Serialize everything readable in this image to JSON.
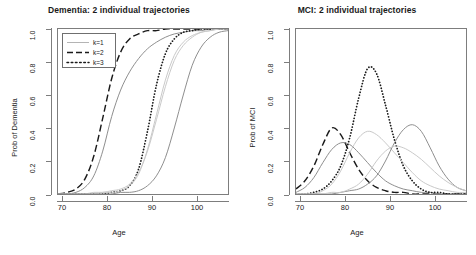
{
  "figure": {
    "xlabel": "Age",
    "panels": [
      {
        "id": "dementia",
        "title": "Dementia: 2 individual trajectories",
        "ylabel": "Prob of Dementia"
      },
      {
        "id": "mci",
        "title": "MCI: 2 individual trajectories",
        "ylabel": "Prob of MCI"
      }
    ]
  },
  "legend": {
    "items": [
      {
        "label": "k=1",
        "style": "solid",
        "color": "#aeaeae"
      },
      {
        "label": "k=2",
        "style": "dashed",
        "color": "#1a1a1a"
      },
      {
        "label": "k=3",
        "style": "dotted",
        "color": "#1a1a1a"
      }
    ]
  },
  "axes": {
    "x_ticks": [
      "70",
      "80",
      "90",
      "100"
    ],
    "y_ticks": [
      "0.0",
      "0.2",
      "0.4",
      "0.6",
      "0.8",
      "1.0"
    ]
  },
  "chart_data": [
    {
      "type": "line",
      "title": "Dementia: 2 individual trajectories",
      "xlabel": "Age",
      "ylabel": "Prob of Dementia",
      "xlim": [
        70,
        108
      ],
      "ylim": [
        0.0,
        1.0
      ],
      "xticks": [
        70,
        80,
        90,
        100
      ],
      "yticks": [
        0.0,
        0.2,
        0.4,
        0.6,
        0.8,
        1.0
      ],
      "grid": false,
      "legend_position": "top-left",
      "note": "Logistic (sigmoid) cumulative probability curves; 2 individual trajectories drawn for each latent class k.",
      "x": [
        70,
        72,
        74,
        76,
        78,
        80,
        82,
        84,
        86,
        88,
        90,
        92,
        94,
        96,
        98,
        100,
        102,
        104,
        106,
        108
      ],
      "series": [
        {
          "name": "k=2 individual A",
          "style": "dashed",
          "color": "#1a1a1a",
          "midpoint_age": 81,
          "values": [
            0.0,
            0.01,
            0.03,
            0.09,
            0.23,
            0.46,
            0.7,
            0.86,
            0.94,
            0.97,
            0.99,
            0.99,
            1.0,
            1.0,
            1.0,
            1.0,
            1.0,
            1.0,
            1.0,
            1.0
          ]
        },
        {
          "name": "k=2 individual B",
          "style": "solid",
          "color": "#8c8c8c",
          "midpoint_age": 83,
          "values": [
            0.0,
            0.0,
            0.01,
            0.04,
            0.11,
            0.26,
            0.47,
            0.63,
            0.74,
            0.82,
            0.88,
            0.92,
            0.95,
            0.97,
            0.98,
            0.99,
            0.99,
            1.0,
            1.0,
            1.0
          ]
        },
        {
          "name": "k=3 individual A",
          "style": "dotted",
          "color": "#1a1a1a",
          "midpoint_age": 90,
          "values": [
            0.0,
            0.0,
            0.0,
            0.0,
            0.0,
            0.0,
            0.01,
            0.02,
            0.05,
            0.15,
            0.38,
            0.66,
            0.85,
            0.94,
            0.98,
            0.99,
            1.0,
            1.0,
            1.0,
            1.0
          ]
        },
        {
          "name": "k=3 individual B",
          "style": "solid",
          "color": "#c8c8c8",
          "midpoint_age": 92,
          "values": [
            0.0,
            0.0,
            0.0,
            0.0,
            0.0,
            0.01,
            0.01,
            0.02,
            0.05,
            0.12,
            0.27,
            0.48,
            0.69,
            0.84,
            0.92,
            0.96,
            0.98,
            0.99,
            1.0,
            1.0
          ]
        },
        {
          "name": "k=1 individual A",
          "style": "solid",
          "color": "#c8c8c8",
          "midpoint_age": 93,
          "values": [
            0.0,
            0.0,
            0.0,
            0.0,
            0.01,
            0.01,
            0.02,
            0.03,
            0.06,
            0.13,
            0.26,
            0.45,
            0.65,
            0.81,
            0.9,
            0.95,
            0.98,
            0.99,
            1.0,
            1.0
          ]
        },
        {
          "name": "k=1 individual B",
          "style": "solid",
          "color": "#8c8c8c",
          "midpoint_age": 97,
          "values": [
            0.0,
            0.0,
            0.0,
            0.0,
            0.0,
            0.0,
            0.0,
            0.01,
            0.01,
            0.02,
            0.05,
            0.11,
            0.22,
            0.4,
            0.6,
            0.78,
            0.89,
            0.95,
            0.98,
            0.99
          ]
        }
      ]
    },
    {
      "type": "line",
      "title": "MCI: 2 individual trajectories",
      "xlabel": "Age",
      "ylabel": "Prob of MCI",
      "xlim": [
        70,
        108
      ],
      "ylim": [
        0.0,
        1.0
      ],
      "xticks": [
        70,
        80,
        90,
        100
      ],
      "yticks": [
        0.0,
        0.2,
        0.4,
        0.6,
        0.8,
        1.0
      ],
      "grid": false,
      "legend_position": "none",
      "note": "Unimodal (bell-shaped) prevalence curves; 2 individual trajectories drawn for each latent class k.",
      "x": [
        70,
        72,
        74,
        76,
        78,
        80,
        82,
        84,
        86,
        88,
        90,
        92,
        94,
        96,
        98,
        100,
        102,
        104,
        106,
        108
      ],
      "series": [
        {
          "name": "k=2 individual A",
          "style": "dashed",
          "color": "#1a1a1a",
          "peak_age": 78.5,
          "peak_value": 0.4,
          "values": [
            0.03,
            0.08,
            0.17,
            0.3,
            0.4,
            0.36,
            0.25,
            0.15,
            0.08,
            0.04,
            0.02,
            0.01,
            0.01,
            0.0,
            0.0,
            0.0,
            0.0,
            0.0,
            0.0,
            0.0
          ]
        },
        {
          "name": "k=2 individual B",
          "style": "solid",
          "color": "#8c8c8c",
          "peak_age": 81,
          "peak_value": 0.31,
          "values": [
            0.01,
            0.04,
            0.1,
            0.19,
            0.27,
            0.31,
            0.3,
            0.25,
            0.19,
            0.13,
            0.08,
            0.05,
            0.03,
            0.02,
            0.01,
            0.01,
            0.0,
            0.0,
            0.0,
            0.0
          ]
        },
        {
          "name": "k=3 individual A",
          "style": "dotted",
          "color": "#1a1a1a",
          "peak_age": 86,
          "peak_value": 0.78,
          "values": [
            0.0,
            0.0,
            0.01,
            0.03,
            0.08,
            0.17,
            0.34,
            0.58,
            0.76,
            0.73,
            0.54,
            0.33,
            0.17,
            0.08,
            0.03,
            0.01,
            0.01,
            0.0,
            0.0,
            0.0
          ]
        },
        {
          "name": "k=3 individual B",
          "style": "solid",
          "color": "#c8c8c8",
          "peak_age": 87,
          "peak_value": 0.38,
          "values": [
            0.0,
            0.0,
            0.0,
            0.02,
            0.06,
            0.14,
            0.25,
            0.34,
            0.38,
            0.36,
            0.31,
            0.25,
            0.19,
            0.13,
            0.08,
            0.05,
            0.03,
            0.02,
            0.01,
            0.01
          ]
        },
        {
          "name": "k=1 individual A",
          "style": "solid",
          "color": "#8c8c8c",
          "peak_age": 95.5,
          "peak_value": 0.42,
          "values": [
            0.0,
            0.0,
            0.0,
            0.0,
            0.0,
            0.01,
            0.02,
            0.03,
            0.06,
            0.11,
            0.2,
            0.31,
            0.39,
            0.42,
            0.38,
            0.28,
            0.17,
            0.09,
            0.04,
            0.02
          ]
        },
        {
          "name": "k=1 individual B",
          "style": "solid",
          "color": "#c8c8c8",
          "peak_age": 93,
          "peak_value": 0.29,
          "values": [
            0.0,
            0.0,
            0.0,
            0.0,
            0.01,
            0.01,
            0.03,
            0.06,
            0.12,
            0.2,
            0.26,
            0.29,
            0.28,
            0.25,
            0.21,
            0.16,
            0.11,
            0.07,
            0.04,
            0.02
          ]
        }
      ]
    }
  ]
}
